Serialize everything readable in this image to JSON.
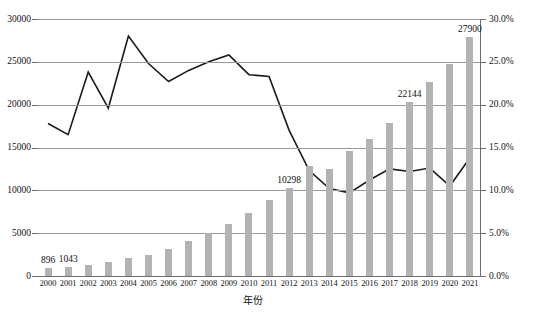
{
  "chart_data": {
    "type": "bar",
    "title": "",
    "xlabel": "年份",
    "ylabel": "",
    "categories": [
      "2000",
      "2001",
      "2002",
      "2003",
      "2004",
      "2005",
      "2006",
      "2007",
      "2008",
      "2009",
      "2010",
      "2011",
      "2012",
      "2013",
      "2014",
      "2015",
      "2016",
      "2017",
      "2018",
      "2019",
      "2020",
      "2021"
    ],
    "grid": true,
    "legend_position": "none",
    "series": [
      {
        "name": "数量",
        "type": "bar",
        "axis": "left",
        "color": "#b3b3b3",
        "values": [
          896,
          1043,
          1300,
          1600,
          2100,
          2500,
          3100,
          4100,
          5000,
          6100,
          7300,
          8900,
          10298,
          12900,
          12500,
          14600,
          16000,
          17900,
          20300,
          22700,
          24800,
          27900
        ],
        "data_labels": {
          "2000": "896",
          "2001": "1043",
          "2012": "10298",
          "2018": "22144",
          "2021": "27900"
        }
      },
      {
        "name": "增长率",
        "type": "line",
        "axis": "right",
        "color": "#1a1a1a",
        "values": [
          17.8,
          16.5,
          23.8,
          19.6,
          28.0,
          24.8,
          22.7,
          24.0,
          25.0,
          25.8,
          23.5,
          23.3,
          17.0,
          12.3,
          10.2,
          9.7,
          11.2,
          12.5,
          12.2,
          12.6,
          10.5,
          13.8
        ]
      }
    ],
    "yaxis_left": {
      "min": 0,
      "max": 30000,
      "step": 5000,
      "ticks": [
        "0",
        "5000",
        "10000",
        "15000",
        "20000",
        "25000",
        "30000"
      ]
    },
    "yaxis_right": {
      "min": 0,
      "max": 30,
      "step": 5,
      "ticks": [
        "0.0%",
        "5.0%",
        "10.0%",
        "15.0%",
        "20.0%",
        "25.0%",
        "30.0%"
      ]
    }
  }
}
